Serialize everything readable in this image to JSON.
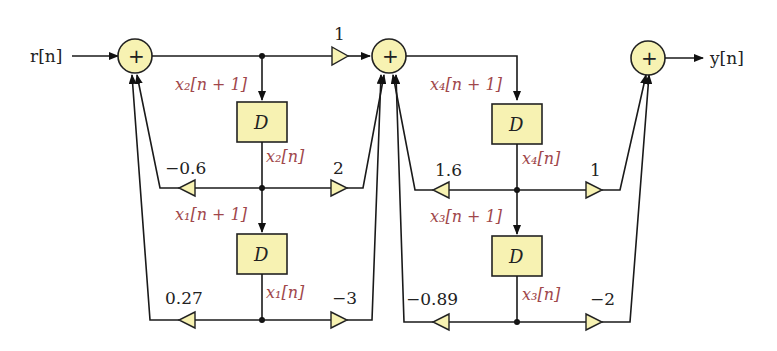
{
  "diagram": {
    "title": "",
    "input_label": "r[n]",
    "output_label": "y[n]",
    "sum_symbol": "+",
    "delay_symbol": "D",
    "colors": {
      "block_fill": "#f7f2b2",
      "state_label": "#a0474b",
      "line": "#1a1a1a"
    },
    "stage1": {
      "state_upper_next": "x₂[n + 1]",
      "state_upper": "x₂[n]",
      "state_lower_next": "x₁[n + 1]",
      "state_lower": "x₁[n]",
      "gain_forward_top": "1",
      "gain_feedback_upper": "−0.6",
      "gain_forward_upper": "2",
      "gain_feedback_lower": "0.27",
      "gain_forward_lower": "−3"
    },
    "stage2": {
      "state_upper_next": "x₄[n + 1]",
      "state_upper": "x₄[n]",
      "state_lower_next": "x₃[n + 1]",
      "state_lower": "x₃[n]",
      "gain_feedback_upper": "1.6",
      "gain_forward_upper": "1",
      "gain_feedback_lower": "−0.89",
      "gain_forward_lower": "−2"
    }
  }
}
